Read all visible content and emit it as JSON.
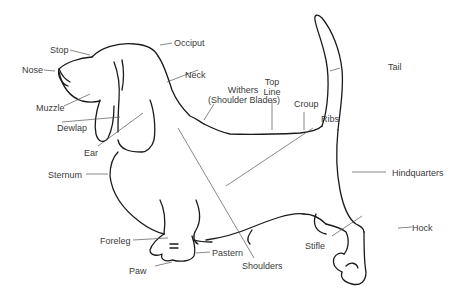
{
  "diagram": {
    "line_color": "#1a1a1a",
    "leader_color": "#555555",
    "labels": {
      "stop": "Stop",
      "nose": "Nose",
      "muzzle": "Muzzle",
      "dewlap": "Dewlap",
      "ear": "Ear",
      "sternum": "Sternum",
      "foreleg": "Foreleg",
      "paw": "Paw",
      "pastern": "Pastern",
      "shoulders": "Shoulders",
      "occiput": "Occiput",
      "neck": "Neck",
      "withers_1": "Withers",
      "withers_2": "(Shoulder Blades)",
      "topline_1": "Top",
      "topline_2": "Line",
      "croup": "Croup",
      "ribs": "Ribs",
      "tail": "Tail",
      "hindquarters": "Hindquarters",
      "stifle": "Stifle",
      "hock": "Hock"
    }
  }
}
